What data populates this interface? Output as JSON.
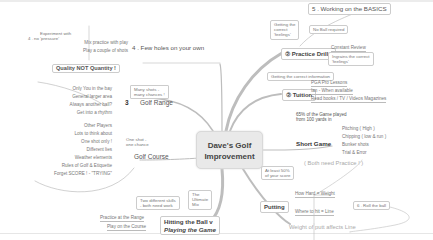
{
  "center": {
    "line1": "Dave's Golf",
    "line2": "Improvement"
  },
  "left_branches": {
    "few_holes": {
      "title": "4 . Few holes on your own",
      "box_line1": "Experiment with",
      "box_line2": "4 . no 'pressure'",
      "items": [
        "Mix practice with play",
        "Play a couple of shots"
      ]
    },
    "golf_range": {
      "number": "3",
      "title": "Golf Range",
      "quality": "Quality NOT Quantity !",
      "box_line1": "Many shots -",
      "box_line2": "many chances !",
      "items": [
        "Only You in the bay",
        "General larger area",
        "Always another ball?",
        "Get into a rhythm"
      ]
    },
    "golf_course": {
      "title": "Golf Course",
      "box_line1": "One shot -",
      "box_line2": "one chance",
      "items": [
        "Other Players",
        "Lots to think about",
        "One shot only !",
        "Different lies",
        "Weather elements",
        "Rules of Golf & Etiquette",
        "Forget SCORE !  - \"TRYING\""
      ]
    },
    "hitting": {
      "title_line1": "Hitting the Ball v",
      "title_line2": "Playing the Game",
      "box1_line1": "Two different skills",
      "box1_line2": "- both need work",
      "box2_line1": "The",
      "box2_line2": "Ultimate",
      "box2_line3": "Mix",
      "items": [
        "Practice at the Range",
        "Play on the Course"
      ]
    }
  },
  "right_branches": {
    "basics": {
      "title": "5 . Working on the BASICS"
    },
    "practice_drills": {
      "title": "Practice Drills",
      "box1_line1": "Getting the",
      "box1_line2": "correct",
      "box1_line3": "'feelings'",
      "box2": "No Ball required",
      "items": [
        "Constant Review",
        "Ingrains the correct",
        "'feelings'"
      ]
    },
    "tuition": {
      "title": "Tuition",
      "box": "Getting the correct information",
      "items": [
        "PGA Pro Lessons",
        "Ian - When available",
        "Read books / TV / Videos Magazines"
      ]
    },
    "short_game": {
      "title": "Short Game",
      "note_line1": "65% of the Game played",
      "note_line2": "from 100 yards in",
      "items": [
        "Pitching ( High )",
        "Chipping ( low & run )",
        "Bunker shots",
        "Trial & Error"
      ],
      "big_note": "( Both need Practice ! )"
    },
    "putting": {
      "title": "Putting",
      "box_line1": "At least 50%",
      "box_line2": "of your score",
      "items": [
        "How Hard = Weight",
        "Where to hit = Line"
      ],
      "roll_box": "6 . Roll the ball",
      "big_note": "Weight of putt affects Line"
    }
  },
  "colors": {
    "branch": "#b5b5b5",
    "center_bg": "#e9e9e9",
    "text": "#444444",
    "muted": "#777777"
  }
}
